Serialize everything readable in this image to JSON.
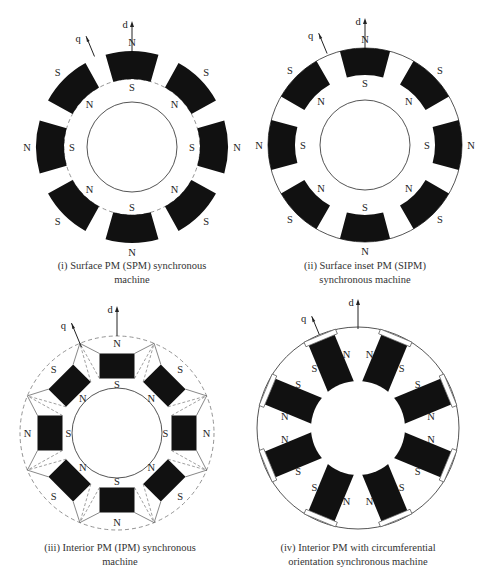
{
  "colors": {
    "magnet": "#111111",
    "line": "#555555",
    "dashed": "#777777",
    "text": "#222222",
    "background": "#ffffff"
  },
  "axes": {
    "d_label": "d",
    "q_label": "q"
  },
  "diagrams": [
    {
      "id": "spm",
      "type": "surface",
      "center": [
        132,
        147
      ],
      "outer_radius": 96,
      "magnet_inner_radius": 68,
      "rotor_radius": 45,
      "magnet_half_angle_deg": 16,
      "rotor_dashed_outline": true,
      "pole_count": 8,
      "labels": {
        "outer": [
          "N",
          "S",
          "N",
          "S",
          "N",
          "S",
          "N",
          "S"
        ],
        "inner": [
          "S",
          "N",
          "S",
          "N",
          "S",
          "N",
          "S",
          "N"
        ]
      },
      "caption": [
        "(i) Surface PM (SPM) synchronous",
        "machine"
      ],
      "caption_pos": [
        22,
        259
      ]
    },
    {
      "id": "sipm",
      "type": "inset",
      "center": [
        365,
        145
      ],
      "outer_radius": 97,
      "magnet_inner_radius": 70,
      "rotor_radius": 45,
      "magnet_half_angle_deg": 15,
      "pole_count": 8,
      "labels": {
        "outer": [
          "N",
          "S",
          "N",
          "S",
          "N",
          "S",
          "N",
          "S"
        ],
        "inner": [
          "S",
          "N",
          "S",
          "N",
          "S",
          "N",
          "S",
          "N"
        ]
      },
      "caption": [
        "(ii) Surface inset PM (SIPM)",
        "synchronous machine"
      ],
      "caption_pos": [
        255,
        259
      ]
    },
    {
      "id": "ipm",
      "type": "interior",
      "center": [
        117,
        433
      ],
      "outer_radius": 97,
      "rotor_radius": 45,
      "magnet_center_radius": 67,
      "magnet_width": 35,
      "magnet_height": 25,
      "pole_count": 8,
      "labels": {
        "outer": [
          "N",
          "S",
          "N",
          "S",
          "N",
          "S",
          "N",
          "S"
        ],
        "inner": [
          "S",
          "N",
          "S",
          "N",
          "S",
          "N",
          "S",
          "N"
        ]
      },
      "caption": [
        "(iii) Interior PM (IPM) synchronous",
        "machine"
      ],
      "caption_pos": [
        10,
        541
      ]
    },
    {
      "id": "circumferential",
      "type": "spoke",
      "center": [
        358,
        428
      ],
      "outer_radius": 101,
      "rotor_radius": 47,
      "spoke_inner_radius": 44,
      "spoke_outer_radius": 95,
      "spoke_width": 28,
      "pole_count": 8,
      "labels": {
        "pairs": [
          [
            "N",
            "N"
          ],
          [
            "S",
            "S"
          ],
          [
            "N",
            "N"
          ],
          [
            "S",
            "S"
          ],
          [
            "N",
            "N"
          ],
          [
            "S",
            "S"
          ],
          [
            "N",
            "N"
          ],
          [
            "S",
            "S"
          ]
        ]
      },
      "caption": [
        "(iv) Interior PM with circumferential",
        "orientation synchronous machine"
      ],
      "caption_pos": [
        248,
        541
      ]
    }
  ]
}
